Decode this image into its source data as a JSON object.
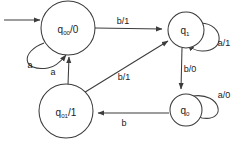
{
  "diagram": {
    "type": "finite-state-machine",
    "title": "",
    "caption": "",
    "stroke_color": "#3c3c3c",
    "text_color": "#1a1a1a",
    "background_color": "#ffffff",
    "states": [
      {
        "id": "q00",
        "name": "q",
        "subscript": "00",
        "separator": "/",
        "output": "0",
        "full_label": "q00/0",
        "cx": 68,
        "cy": 28,
        "r": 27,
        "initial": true
      },
      {
        "id": "q1",
        "name": "q",
        "subscript": "1",
        "separator": "",
        "output": "",
        "full_label": "q1",
        "cx": 186,
        "cy": 30,
        "r": 18,
        "initial": false
      },
      {
        "id": "q01",
        "name": "q",
        "subscript": "01",
        "separator": "/",
        "output": "1",
        "full_label": "q01/1",
        "cx": 66,
        "cy": 111,
        "r": 27,
        "initial": false
      },
      {
        "id": "q0",
        "name": "q",
        "subscript": "0",
        "separator": "",
        "output": "",
        "full_label": "q0",
        "cx": 186,
        "cy": 110,
        "r": 16,
        "initial": false
      }
    ],
    "start_arrow": {
      "label": "",
      "from_x": 4,
      "to_x": 40,
      "y": 20
    },
    "transitions": [
      {
        "id": "t-q00-self",
        "from": "q00",
        "to": "q00",
        "label": "a",
        "input": "a",
        "output": "",
        "kind": "self-loop",
        "label_x": 30,
        "label_y": 65
      },
      {
        "id": "t-q00-q1",
        "from": "q00",
        "to": "q1",
        "label": "b/1",
        "input": "b",
        "output": "1",
        "kind": "straight",
        "label_x": 123,
        "label_y": 21
      },
      {
        "id": "t-q1-self",
        "from": "q1",
        "to": "q1",
        "label": "a/1",
        "input": "a",
        "output": "1",
        "kind": "self-loop",
        "label_x": 224,
        "label_y": 43
      },
      {
        "id": "t-q1-q0",
        "from": "q1",
        "to": "q0",
        "label": "b/0",
        "input": "b",
        "output": "0",
        "kind": "straight",
        "label_x": 190,
        "label_y": 69
      },
      {
        "id": "t-q0-self",
        "from": "q0",
        "to": "q0",
        "label": "a/0",
        "input": "a",
        "output": "0",
        "kind": "self-loop",
        "label_x": 224,
        "label_y": 95
      },
      {
        "id": "t-q0-q01",
        "from": "q0",
        "to": "q01",
        "label": "b",
        "input": "b",
        "output": "",
        "kind": "straight",
        "label_x": 124,
        "label_y": 123
      },
      {
        "id": "t-q01-q00",
        "from": "q01",
        "to": "q00",
        "label": "a",
        "input": "a",
        "output": "",
        "kind": "straight",
        "label_x": 53,
        "label_y": 72
      },
      {
        "id": "t-q01-q1",
        "from": "q01",
        "to": "q1",
        "label": "b/1",
        "input": "b",
        "output": "1",
        "kind": "diagonal",
        "label_x": 124,
        "label_y": 77
      }
    ]
  }
}
